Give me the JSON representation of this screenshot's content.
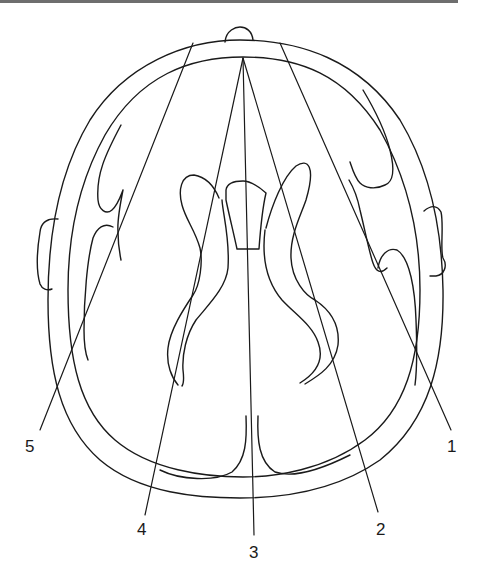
{
  "figure": {
    "type": "anatomical schematic",
    "line_color": "#1a1a1a",
    "background": "#ffffff",
    "top_rule_color": "#6e6e6e"
  },
  "labels": [
    {
      "id": "1",
      "text": "1"
    },
    {
      "id": "2",
      "text": "2"
    },
    {
      "id": "3",
      "text": "3"
    },
    {
      "id": "4",
      "text": "4"
    },
    {
      "id": "5",
      "text": "5"
    }
  ],
  "icons": {
    "left_ear": "left-ear-shape",
    "right_ear": "right-ear-shape",
    "nose": "nose-bump-shape"
  }
}
